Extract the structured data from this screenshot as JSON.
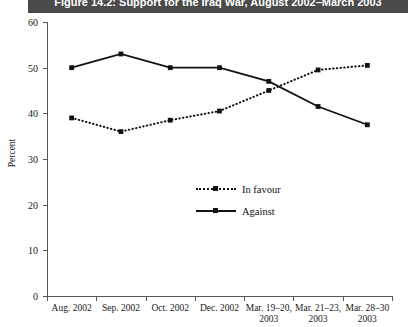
{
  "figure": {
    "title": "Figure 14.2: Support for the Iraq War, August 2002–March 2003",
    "title_bg": "#4a4a4a",
    "title_color": "#ffffff"
  },
  "chart_data": {
    "type": "line",
    "title": "Figure 14.2: Support for the Iraq War, August 2002–March 2003",
    "xlabel": "",
    "ylabel": "Percent",
    "ylim": [
      0,
      60
    ],
    "yticks": [
      0,
      10,
      20,
      30,
      40,
      50,
      60
    ],
    "ytick_labels": [
      "0",
      "10",
      "20",
      "30",
      "40",
      "50",
      "60"
    ],
    "grid": false,
    "legend_position": "center",
    "categories": [
      "Aug. 2002",
      "Sep. 2002",
      "Oct. 2002",
      "Dec. 2002",
      "Mar. 19–20, 2003",
      "Mar. 21–23, 2003",
      "Mar. 28–30, 2003"
    ],
    "category_lines": [
      [
        "Aug. 2002",
        ""
      ],
      [
        "Sep. 2002",
        ""
      ],
      [
        "Oct. 2002",
        ""
      ],
      [
        "Dec. 2002",
        ""
      ],
      [
        "Mar. 19–20,",
        "2003"
      ],
      [
        "Mar. 21–23,",
        "2003"
      ],
      [
        "Mar. 28–30",
        "2003"
      ]
    ],
    "series": [
      {
        "name": "In favour",
        "style": "dotted",
        "color": "#111111",
        "values": [
          39,
          36,
          38.5,
          40.5,
          45,
          49.5,
          50.5
        ]
      },
      {
        "name": "Against",
        "style": "solid",
        "color": "#111111",
        "values": [
          50,
          53,
          50,
          50,
          47,
          41.5,
          37.5
        ]
      }
    ]
  },
  "legend": {
    "items": [
      {
        "label": "In favour",
        "style": "dotted"
      },
      {
        "label": "Against",
        "style": "solid"
      }
    ]
  }
}
